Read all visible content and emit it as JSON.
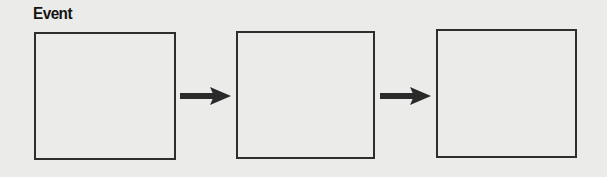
{
  "diagram": {
    "title": "Event",
    "type": "flow-sequence",
    "boxes": [
      {
        "id": "box-1",
        "label": ""
      },
      {
        "id": "box-2",
        "label": ""
      },
      {
        "id": "box-3",
        "label": ""
      }
    ],
    "arrows": [
      {
        "from": "box-1",
        "to": "box-2"
      },
      {
        "from": "box-2",
        "to": "box-3"
      }
    ],
    "colors": {
      "background": "#ebebe9",
      "stroke": "#2e2e2e",
      "arrow": "#2a2a2a",
      "title": "#141414"
    }
  }
}
